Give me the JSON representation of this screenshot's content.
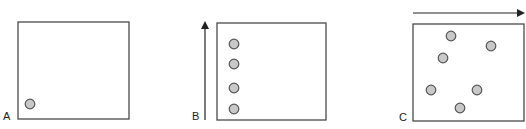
{
  "colors": {
    "stroke": "#4a4a4a",
    "circle_fill": "#c8c8c8",
    "circle_stroke": "#555555",
    "label": "#222222"
  },
  "panels": [
    {
      "label": "A",
      "label_pos": [
        3,
        120
      ],
      "box": {
        "x": 18,
        "y": 22,
        "w": 111,
        "h": 97
      },
      "arrow": null,
      "circles": [
        [
          30,
          104
        ]
      ]
    },
    {
      "label": "B",
      "label_pos": [
        192,
        120
      ],
      "box": {
        "x": 217,
        "y": 23,
        "w": 109,
        "h": 97
      },
      "arrow": {
        "direction": "up",
        "x1": 205,
        "y1": 120,
        "x2": 205,
        "y2": 23
      },
      "circles": [
        [
          234,
          44
        ],
        [
          234,
          64
        ],
        [
          234,
          88
        ],
        [
          234,
          109
        ]
      ]
    },
    {
      "label": "C",
      "label_pos": [
        399,
        121
      ],
      "box": {
        "x": 413,
        "y": 24,
        "w": 111,
        "h": 97
      },
      "arrow": {
        "direction": "right",
        "x1": 413,
        "y1": 13,
        "x2": 523,
        "y2": 13
      },
      "circles": [
        [
          451,
          36
        ],
        [
          491,
          46
        ],
        [
          443,
          58
        ],
        [
          431,
          90
        ],
        [
          477,
          90
        ],
        [
          460,
          108
        ]
      ]
    }
  ]
}
